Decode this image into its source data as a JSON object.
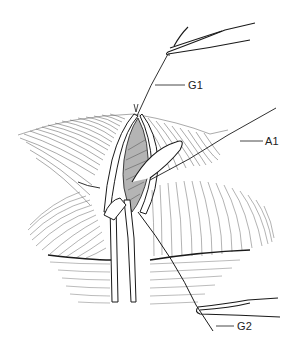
{
  "figure": {
    "type": "surgical line illustration",
    "labels": {
      "g1": "G1",
      "a1": "A1",
      "g2": "G2"
    },
    "colors": {
      "ink": "#1a1a1a",
      "hatch": "#555555",
      "background": "#ffffff"
    }
  }
}
